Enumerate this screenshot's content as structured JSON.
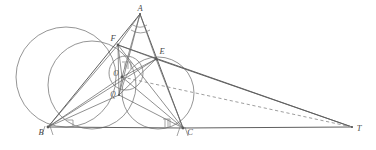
{
  "figure": {
    "width": 376,
    "height": 150,
    "background": "#ffffff",
    "stroke_color": "#6f6f6f",
    "stroke_color_dark": "#5a5a5a",
    "stroke_color_light": "#8a8a8a",
    "dash_color": "#8d8d8d",
    "label_color": "#4a4a4a"
  },
  "points": {
    "A": {
      "label": "A",
      "x": 140,
      "y": 14,
      "lx": 140,
      "ly": 11
    },
    "B": {
      "label": "B",
      "x": 48,
      "y": 127,
      "lx": 41,
      "ly": 135
    },
    "C": {
      "label": "C",
      "x": 183,
      "y": 128,
      "lx": 190,
      "ly": 135
    },
    "E": {
      "label": "E",
      "x": 156,
      "y": 59,
      "lx": 161,
      "ly": 54
    },
    "F": {
      "label": "F",
      "x": 118,
      "y": 45,
      "lx": 113,
      "ly": 41
    },
    "O": {
      "label": "O",
      "x": 122,
      "y": 77,
      "lx": 117,
      "ly": 75
    },
    "Q": {
      "label": "Q",
      "x": 119,
      "y": 95,
      "lx": 114,
      "ly": 97
    },
    "T": {
      "label": "T",
      "x": 352,
      "y": 127,
      "lx": 358,
      "ly": 131
    }
  },
  "circles": [
    {
      "name": "large-left-circle",
      "cx": 66,
      "cy": 77,
      "r": 50
    },
    {
      "name": "circle-through-B-F-O",
      "cx": 92,
      "cy": 85,
      "r": 44
    },
    {
      "name": "circle-through-E-C-Q",
      "cx": 158,
      "cy": 93,
      "r": 36
    },
    {
      "name": "small-incircle-center",
      "cx": 126,
      "cy": 73,
      "r": 17
    }
  ],
  "segments": [
    {
      "name": "side-AB",
      "from": "A",
      "to": "B"
    },
    {
      "name": "side-AC",
      "from": "A",
      "to": "C"
    },
    {
      "name": "side-BC",
      "from": "B",
      "to": "C"
    },
    {
      "name": "base-extension-C-T",
      "from": "C",
      "to": "T"
    },
    {
      "name": "cevian-A-O",
      "from": "A",
      "to": "O"
    },
    {
      "name": "cevian-A-Q",
      "from": "A",
      "to": "Q"
    },
    {
      "name": "segment-B-E",
      "from": "B",
      "to": "E"
    },
    {
      "name": "segment-C-F",
      "from": "C",
      "to": "F"
    },
    {
      "name": "segment-F-E",
      "from": "F",
      "to": "E"
    },
    {
      "name": "segment-F-C",
      "from": "F",
      "to": "C"
    },
    {
      "name": "segment-E-B",
      "from": "E",
      "to": "B"
    },
    {
      "name": "segment-B-O",
      "from": "B",
      "to": "O"
    },
    {
      "name": "segment-C-O",
      "from": "C",
      "to": "O"
    },
    {
      "name": "segment-B-Q",
      "from": "B",
      "to": "Q"
    },
    {
      "name": "segment-C-Q",
      "from": "C",
      "to": "Q"
    },
    {
      "name": "segment-O-Q",
      "from": "O",
      "to": "Q"
    },
    {
      "name": "segment-F-Q",
      "from": "F",
      "to": "Q"
    },
    {
      "name": "segment-E-Q",
      "from": "E",
      "to": "Q"
    },
    {
      "name": "segment-F-O",
      "from": "F",
      "to": "O"
    },
    {
      "name": "segment-E-O",
      "from": "E",
      "to": "O"
    },
    {
      "name": "segment-E-T",
      "from": "E",
      "to": "T"
    },
    {
      "name": "segment-F-T-upper",
      "from": "F",
      "to": "T"
    }
  ],
  "dashed_segments": [
    {
      "name": "dashed-O-to-T",
      "from": "O",
      "to": "T"
    }
  ],
  "marks": {
    "right_angle_at_B": {
      "name": "right-angle-mark-B",
      "x": 70,
      "y": 119
    },
    "right_angle_at_C": {
      "name": "right-angle-mark-C",
      "x": 166,
      "y": 117
    },
    "right_angle_at_O": {
      "name": "right-angle-mark-O",
      "x": 126,
      "y": 66
    },
    "tick_B": {
      "name": "tick-mark-B",
      "x": 48,
      "y": 127
    },
    "tick_C": {
      "name": "tick-mark-C",
      "x": 183,
      "y": 128
    },
    "angle_arcs_A": {
      "name": "angle-arc-A",
      "x": 140,
      "y": 14
    }
  }
}
